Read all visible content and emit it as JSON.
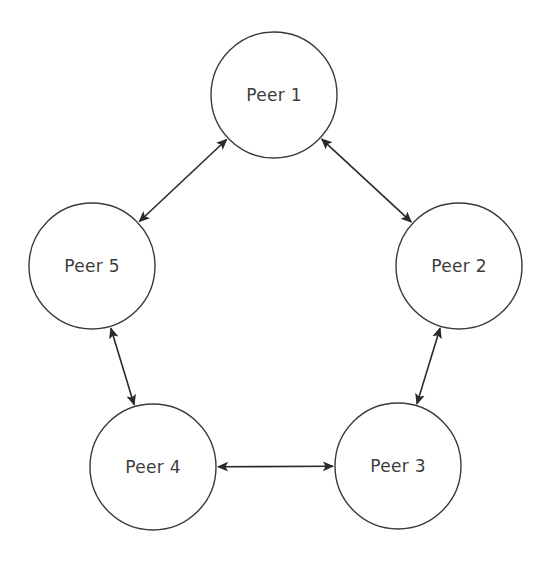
{
  "diagram": {
    "background_color": "#ffffff",
    "node_fill": "#ffffff",
    "node_stroke": "#3a3a3a",
    "link_color": "#2a2a2a",
    "label_color": "#3c3c3c",
    "node_radius": 63,
    "canvas": {
      "width": 551,
      "height": 566
    },
    "nodes": [
      {
        "id": "peer-1",
        "label": "Peer 1",
        "cx": 274,
        "cy": 95
      },
      {
        "id": "peer-2",
        "label": "Peer 2",
        "cx": 459,
        "cy": 266
      },
      {
        "id": "peer-3",
        "label": "Peer 3",
        "cx": 398,
        "cy": 466
      },
      {
        "id": "peer-4",
        "label": "Peer 4",
        "cx": 153,
        "cy": 467
      },
      {
        "id": "peer-5",
        "label": "Peer 5",
        "cx": 92,
        "cy": 266
      }
    ],
    "links": [
      {
        "id": "link-peer-5-peer-1",
        "from": "peer-5",
        "to": "peer-1",
        "arrow": "both"
      },
      {
        "id": "link-peer-1-peer-2",
        "from": "peer-1",
        "to": "peer-2",
        "arrow": "both"
      },
      {
        "id": "link-peer-2-peer-3",
        "from": "peer-2",
        "to": "peer-3",
        "arrow": "both"
      },
      {
        "id": "link-peer-3-peer-4",
        "from": "peer-3",
        "to": "peer-4",
        "arrow": "both"
      },
      {
        "id": "link-peer-4-peer-5",
        "from": "peer-4",
        "to": "peer-5",
        "arrow": "both"
      }
    ]
  }
}
